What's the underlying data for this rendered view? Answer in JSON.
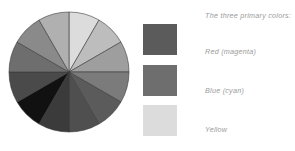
{
  "canvas": {
    "width": 295,
    "height": 151,
    "background": "#ffffff"
  },
  "legend": {
    "heading": "The three primary colors:",
    "text_color": "#9a9a9a",
    "items": [
      {
        "label": "Red (magenta)",
        "swatch_color": "#5b5b5b",
        "name": "red-magenta"
      },
      {
        "label": "Blue (cyan)",
        "swatch_color": "#6e6e6e",
        "name": "blue-cyan"
      },
      {
        "label": "Yellow",
        "swatch_color": "#dcdcdc",
        "name": "yellow"
      }
    ]
  },
  "chart_data": {
    "type": "pie",
    "title": "",
    "xlabel": "",
    "ylabel": "",
    "legend_position": "right",
    "grid": false,
    "center": [
      61,
      61
    ],
    "radius": 60,
    "start_angle_deg": -90,
    "categories": [
      "yellow",
      "yellow-orange",
      "orange",
      "red-orange",
      "red (magenta)",
      "red-violet",
      "violet",
      "blue-violet",
      "blue (cyan)",
      "blue-green",
      "green",
      "yellow-green"
    ],
    "values": [
      1,
      1,
      1,
      1,
      1,
      1,
      1,
      1,
      1,
      1,
      1,
      1
    ],
    "slice_colors": [
      "#dcdcdc",
      "#bdbdbd",
      "#9e9e9e",
      "#7b7b7b",
      "#5b5b5b",
      "#4f4f4f",
      "#3b3b3b",
      "#111111",
      "#4a4a4a",
      "#6e6e6e",
      "#8a8a8a",
      "#b0b0b0"
    ],
    "slice_separator_color": "#3a3a3a",
    "slice_count": 12
  }
}
